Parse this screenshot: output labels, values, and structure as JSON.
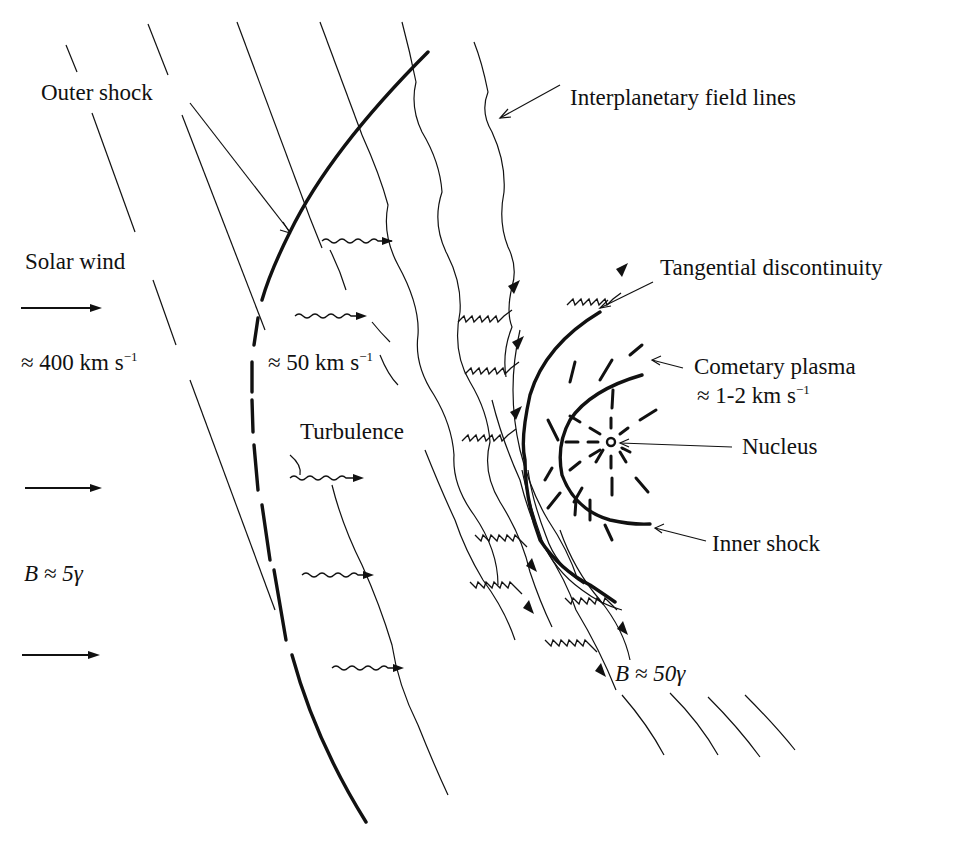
{
  "figure": {
    "background": "#ffffff",
    "ink": "#111111"
  },
  "labels": {
    "outer_shock": "Outer shock",
    "interplanetary_field_lines": "Interplanetary field lines",
    "solar_wind": "Solar wind",
    "solar_wind_speed_approx": "≈ 400 km s",
    "solar_wind_speed_exp": "−1",
    "post_shock_speed_approx": "≈ 50 km s",
    "post_shock_speed_exp": "−1",
    "turbulence": "Turbulence",
    "tangential_discontinuity": "Tangential discontinuity",
    "cometary_plasma": "Cometary plasma",
    "cometary_plasma_speed": "≈ 1-2 km s",
    "cometary_plasma_speed_exp": "−1",
    "nucleus": "Nucleus",
    "inner_shock": "Inner shock",
    "b_upstream_var": "B",
    "b_upstream_val": " ≈ 5γ",
    "b_downstream_var": "B",
    "b_downstream_val": " ≈ 50γ"
  },
  "regions": [
    {
      "name": "upstream solar wind",
      "speed": "≈ 400 km s−1",
      "field": "B ≈ 5γ"
    },
    {
      "name": "post outer shock",
      "speed": "≈ 50 km s−1",
      "feature": "Turbulence"
    },
    {
      "name": "cometary plasma",
      "speed": "≈ 1-2 km s−1"
    },
    {
      "name": "pileup near discontinuity",
      "field": "B ≈ 50γ"
    }
  ]
}
